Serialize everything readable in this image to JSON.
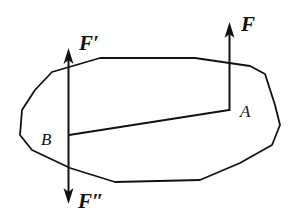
{
  "diagram": {
    "colors": {
      "stroke": "#111111",
      "background": "#ffffff"
    },
    "labels": {
      "force_A": "F",
      "force_B_up": "F′",
      "force_B_down": "F″",
      "point_A": "A",
      "point_B": "B"
    },
    "points": {
      "A": [
        229,
        110
      ],
      "B": [
        69,
        135
      ]
    }
  }
}
